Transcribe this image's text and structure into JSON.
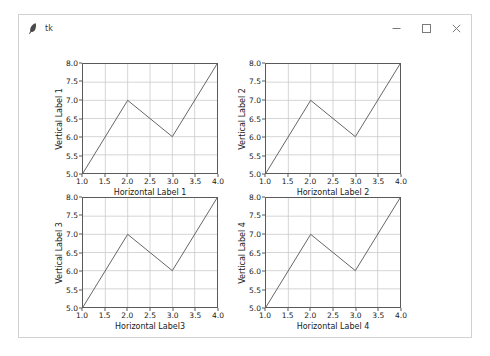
{
  "window": {
    "title": "tk",
    "app_icon": "feather-icon",
    "controls": [
      {
        "name": "minimize-button",
        "glyph": "minimize-icon"
      },
      {
        "name": "maximize-button",
        "glyph": "maximize-icon"
      },
      {
        "name": "close-button",
        "glyph": "close-icon"
      }
    ]
  },
  "chart_data": [
    {
      "type": "line",
      "title": "",
      "xlabel": "Horizontal Label 1",
      "ylabel": "Vertical Label 1",
      "x": [
        1,
        2,
        3,
        4
      ],
      "values": [
        5,
        7,
        6,
        8
      ],
      "xlim": [
        1.0,
        4.0
      ],
      "ylim": [
        5.0,
        8.0
      ],
      "xticks": [
        "1.0",
        "1.5",
        "2.0",
        "2.5",
        "3.0",
        "3.5",
        "4.0"
      ],
      "yticks": [
        "5.0",
        "5.5",
        "6.0",
        "6.5",
        "7.0",
        "7.5",
        "8.0"
      ],
      "grid": true,
      "legend": "none",
      "line_color": "#555555"
    },
    {
      "type": "line",
      "title": "",
      "xlabel": "Horizontal Label 2",
      "ylabel": "Vertical Label 2",
      "x": [
        1,
        2,
        3,
        4
      ],
      "values": [
        5,
        7,
        6,
        8
      ],
      "xlim": [
        1.0,
        4.0
      ],
      "ylim": [
        5.0,
        8.0
      ],
      "xticks": [
        "1.0",
        "1.5",
        "2.0",
        "2.5",
        "3.0",
        "3.5",
        "4.0"
      ],
      "yticks": [
        "5.0",
        "5.5",
        "6.0",
        "6.5",
        "7.0",
        "7.5",
        "8.0"
      ],
      "grid": true,
      "legend": "none",
      "line_color": "#555555"
    },
    {
      "type": "line",
      "title": "",
      "xlabel": "Horizontal Label3",
      "ylabel": "Vertical Label 3",
      "x": [
        1,
        2,
        3,
        4
      ],
      "values": [
        5,
        7,
        6,
        8
      ],
      "xlim": [
        1.0,
        4.0
      ],
      "ylim": [
        5.0,
        8.0
      ],
      "xticks": [
        "1.0",
        "1.5",
        "2.0",
        "2.5",
        "3.0",
        "3.5",
        "4.0"
      ],
      "yticks": [
        "5.0",
        "5.5",
        "6.0",
        "6.5",
        "7.0",
        "7.5",
        "8.0"
      ],
      "grid": true,
      "legend": "none",
      "line_color": "#555555"
    },
    {
      "type": "line",
      "title": "",
      "xlabel": "Horizontal Label 4",
      "ylabel": "Vertical Label 4",
      "x": [
        1,
        2,
        3,
        4
      ],
      "values": [
        5,
        7,
        6,
        8
      ],
      "xlim": [
        1.0,
        4.0
      ],
      "ylim": [
        5.0,
        8.0
      ],
      "xticks": [
        "1.0",
        "1.5",
        "2.0",
        "2.5",
        "3.0",
        "3.5",
        "4.0"
      ],
      "yticks": [
        "5.0",
        "5.5",
        "6.0",
        "6.5",
        "7.0",
        "7.5",
        "8.0"
      ],
      "grid": true,
      "legend": "none",
      "line_color": "#555555"
    }
  ],
  "colors": {
    "grid": "#c9c9c9",
    "axis": "#5a5a5a",
    "line": "#555555",
    "text": "#1a1a1a",
    "window_border": "#d2d2d2",
    "background": "#ffffff"
  }
}
